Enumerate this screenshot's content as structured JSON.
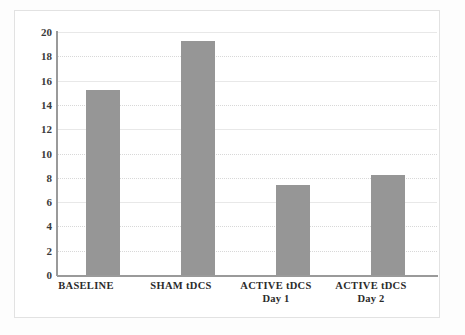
{
  "chart_data": {
    "type": "bar",
    "title": "",
    "subtitle": "",
    "xlabel": "",
    "ylabel": "",
    "categories": [
      "BASELINE",
      "SHAM tDCS",
      "ACTIVE tDCS Day 1",
      "ACTIVE tDCS Day 2"
    ],
    "category_lines": [
      {
        "line1": "BASELINE",
        "line2": ""
      },
      {
        "line1": "SHAM tDCS",
        "line2": ""
      },
      {
        "line1": "ACTIVE tDCS",
        "line2": "Day 1"
      },
      {
        "line1": "ACTIVE tDCS",
        "line2": "Day 2"
      }
    ],
    "values": [
      15.2,
      19.3,
      7.4,
      8.2
    ],
    "ylim": [
      0,
      20
    ],
    "ytick_labels": [
      "20",
      "18",
      "16",
      "14",
      "12",
      "10",
      "8",
      "6",
      "4",
      "2",
      "0"
    ],
    "ytick_values": [
      20,
      18,
      16,
      14,
      12,
      10,
      8,
      6,
      4,
      2,
      0
    ],
    "grid": true,
    "grid_axis": "y",
    "legend": false,
    "legend_position": "none",
    "bar_color": "#969696",
    "axis_color": "#9a9a9a",
    "grid_color": "#d8d8d8",
    "background_color": "#ffffff",
    "frame_color": "#e2e2e2"
  }
}
